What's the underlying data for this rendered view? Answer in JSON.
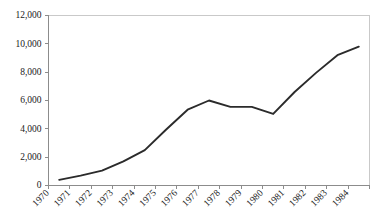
{
  "chart_data": {
    "type": "line",
    "title": "",
    "subtitle": "",
    "xlabel": "",
    "ylabel": "",
    "grid": false,
    "legend": "none",
    "line_color": "#2b2b2b",
    "axis_color": "#8c8c8c",
    "border_color": "#c9c9c9",
    "xlim": [
      1970,
      1985
    ],
    "ylim": [
      0,
      12000
    ],
    "x_tick_labels": [
      "1970",
      "1971",
      "1972",
      "1973",
      "1974",
      "1975",
      "1976",
      "1977",
      "1978",
      "1979",
      "1980",
      "1981",
      "1982",
      "1983",
      "1984"
    ],
    "y_tick_labels": [
      "0",
      "2,000",
      "4,000",
      "6,000",
      "8,000",
      "10,000",
      "12,000"
    ],
    "y_tick_values": [
      0,
      2000,
      4000,
      6000,
      8000,
      10000,
      12000
    ],
    "categories": [
      "1970",
      "1971",
      "1972",
      "1973",
      "1974",
      "1975",
      "1976",
      "1977",
      "1978",
      "1979",
      "1980",
      "1981",
      "1982",
      "1983",
      "1984"
    ],
    "x": [
      1970.5,
      1971.5,
      1972.5,
      1973.5,
      1974.5,
      1975.5,
      1976.5,
      1977.5,
      1978.5,
      1979.5,
      1980.5,
      1981.5,
      1982.5,
      1983.5,
      1984.5
    ],
    "values": [
      400,
      700,
      1050,
      1700,
      2500,
      3950,
      5350,
      6000,
      5550,
      5550,
      5050,
      6600,
      7950,
      9200,
      9800
    ]
  }
}
